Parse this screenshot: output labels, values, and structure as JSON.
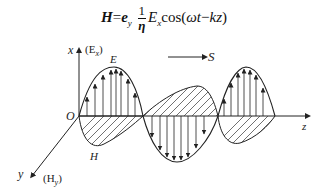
{
  "formula": {
    "lhs": "H",
    "equals": "=",
    "unit_vector": "e",
    "unit_sub": "y",
    "frac_num": "1",
    "frac_den": "η",
    "amp": "E",
    "amp_sub": "x",
    "func": "cos(",
    "arg_omega": "ωt",
    "arg_minus": "−",
    "arg_kz": "kz",
    "close": ")"
  },
  "labels": {
    "x_axis": "x",
    "x_component": "(E",
    "x_component_sub": "x",
    "x_component_close": ")",
    "E": "E",
    "S": "S",
    "origin": "O",
    "z_axis": "z",
    "H": "H",
    "y_axis": "y",
    "y_component": "(H",
    "y_component_sub": "y",
    "y_component_close": ")"
  },
  "colors": {
    "line": "#222222",
    "background": "#ffffff"
  }
}
